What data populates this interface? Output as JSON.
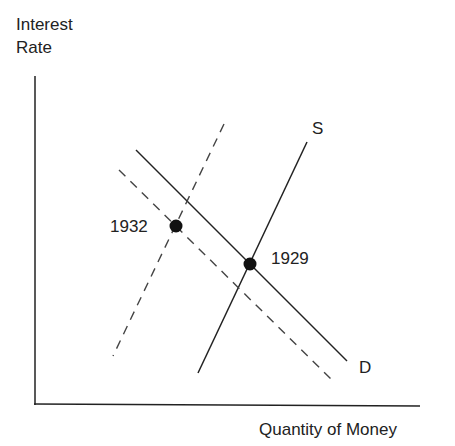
{
  "diagram": {
    "y_axis_label_line1": "Interest",
    "y_axis_label_line2": "Rate",
    "x_axis_label": "Quantity of Money",
    "supply_label": "S",
    "demand_label": "D",
    "point_1932_label": "1932",
    "point_1929_label": "1929",
    "colors": {
      "line": "#222222",
      "dashed": "#444444",
      "background": "#ffffff"
    },
    "curves": [
      {
        "name": "supply-1929",
        "style": "solid",
        "from": [
          307,
          142
        ],
        "to": [
          198,
          373
        ]
      },
      {
        "name": "demand-1929",
        "style": "solid",
        "from": [
          136,
          150
        ],
        "to": [
          347,
          361
        ]
      },
      {
        "name": "supply-1932",
        "style": "dashed",
        "from": [
          224,
          124
        ],
        "to": [
          113,
          356
        ]
      },
      {
        "name": "demand-1932",
        "style": "dashed",
        "from": [
          119,
          170
        ],
        "to": [
          333,
          381
        ]
      }
    ],
    "points": [
      {
        "label": "1932",
        "at": [
          176,
          226
        ]
      },
      {
        "label": "1929",
        "at": [
          250,
          264
        ]
      }
    ]
  }
}
